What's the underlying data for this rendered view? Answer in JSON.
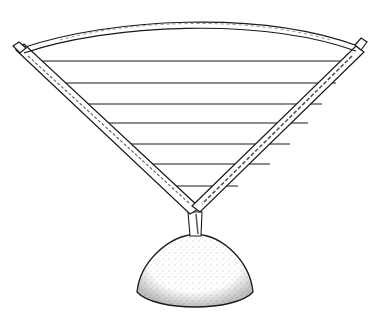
{
  "illustration": {
    "subject": "Line drawing of a fan-shaped frame of two sticks forming a V, joined at the top by a curved bow, with seven horizontal strings stretched across, mounted on a stippled dome-shaped base",
    "colors": {
      "background": "#ffffff",
      "ink": "#1a1a1a",
      "stipple": "#555555"
    },
    "strings": [
      {
        "y": 61,
        "x1": 38,
        "x2": 352
      },
      {
        "y": 83,
        "x1": 60,
        "x2": 336
      },
      {
        "y": 104,
        "x1": 80,
        "x2": 322
      },
      {
        "y": 123,
        "x1": 100,
        "x2": 308
      },
      {
        "y": 144,
        "x1": 122,
        "x2": 290
      },
      {
        "y": 164,
        "x1": 145,
        "x2": 270
      },
      {
        "y": 186,
        "x1": 167,
        "x2": 238
      }
    ]
  }
}
